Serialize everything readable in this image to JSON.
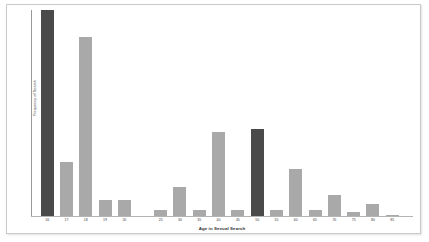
{
  "figure": {
    "background_color": "#ffffff",
    "border_color": "#c9c9c9"
  },
  "axes": {
    "x_title": "Age in Sexual Search",
    "y_title": "Frequency of Search",
    "spine_color": "#9a9a9a"
  },
  "chart_data": {
    "type": "bar",
    "title": "",
    "xlabel": "Age in Sexual Search",
    "ylabel": "Frequency of Search",
    "categories": [
      "16",
      "17",
      "18",
      "19",
      "20",
      "25",
      "30",
      "35",
      "40",
      "45",
      "50",
      "55",
      "60",
      "65",
      "70",
      "75",
      "80",
      "85"
    ],
    "values": [
      100,
      26,
      87,
      8,
      8,
      3,
      14,
      3,
      41,
      3,
      42,
      3,
      23,
      3,
      10,
      2,
      6,
      0.5
    ],
    "bar_colors": [
      "#4a4a4a",
      "#a9a9a9",
      "#a9a9a9",
      "#a9a9a9",
      "#a9a9a9",
      "#a9a9a9",
      "#a9a9a9",
      "#a9a9a9",
      "#a9a9a9",
      "#a9a9a9",
      "#4a4a4a",
      "#a9a9a9",
      "#a9a9a9",
      "#a9a9a9",
      "#a9a9a9",
      "#a9a9a9",
      "#a9a9a9",
      "#a9a9a9"
    ],
    "highlight_color": "#4a4a4a",
    "default_bar_color": "#a9a9a9",
    "ylim": [
      0,
      100
    ],
    "y_ticks_shown": false,
    "grid": false,
    "legend": "none",
    "note": "Bar group for ages 16-20 is contiguous, then a visual gap before the 25-85 five-year bins. Bars at 16 and 50 are rendered in a darker shade."
  }
}
